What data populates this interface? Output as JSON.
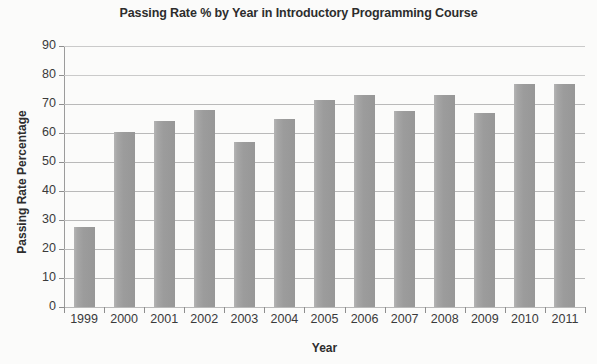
{
  "chart_data": {
    "type": "bar",
    "title": "Passing Rate % by Year in Introductory Programming Course",
    "xlabel": "Year",
    "ylabel": "Passing Rate Percentage",
    "categories": [
      "1999",
      "2000",
      "2001",
      "2002",
      "2003",
      "2004",
      "2005",
      "2006",
      "2007",
      "2008",
      "2009",
      "2010",
      "2011"
    ],
    "values": [
      27.5,
      60.5,
      64,
      68,
      57,
      65,
      71.5,
      73,
      67.5,
      73,
      67,
      77,
      77
    ],
    "ylim": [
      0,
      90
    ],
    "ytick_labels": [
      "90",
      "80",
      "70",
      "60",
      "50",
      "40",
      "30",
      "20",
      "10",
      "0"
    ],
    "ytick_values": [
      90,
      80,
      70,
      60,
      50,
      40,
      30,
      20,
      10,
      0
    ],
    "ytick_step": 10,
    "grid": true,
    "grid_axis": "y",
    "legend": null,
    "series_color": "#9c9c9c",
    "axis_color": "#8e8e8e",
    "grid_color": "#b9b9b9",
    "text_color": "#2d2d2d",
    "background_color": "#fbfbfa"
  }
}
